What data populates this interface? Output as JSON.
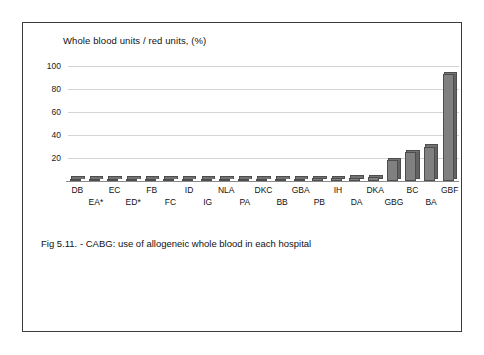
{
  "figure": {
    "caption": "Fig 5.11. - CABG: use of allogeneic whole blood in each hospital"
  },
  "chart_data": {
    "type": "bar",
    "title": "",
    "ylabel": "Whole blood units / red units, (%)",
    "xlabel": "",
    "ylim": [
      0,
      100
    ],
    "yticks": [
      100,
      80,
      60,
      40,
      20
    ],
    "ytick_labels": [
      "100",
      "80",
      "60",
      "40",
      "20"
    ],
    "grid": true,
    "legend": "none",
    "categories": [
      "DB",
      "EA*",
      "EC",
      "ED*",
      "FB",
      "FC",
      "ID",
      "IG",
      "NLA",
      "PA",
      "DKC",
      "BB",
      "GBA",
      "PB",
      "IH",
      "DA",
      "DKA",
      "GBG",
      "BC",
      "BA",
      "GBF"
    ],
    "values": [
      0,
      0,
      0,
      0,
      0,
      0,
      0,
      0,
      0,
      0,
      1.5,
      1.8,
      2.0,
      2.2,
      2.6,
      3.0,
      3.4,
      18,
      25,
      30,
      93
    ],
    "series": [
      {
        "name": "Whole blood units / red units, (%)",
        "values": [
          0,
          0,
          0,
          0,
          0,
          0,
          0,
          0,
          0,
          0,
          1.5,
          1.8,
          2.0,
          2.2,
          2.6,
          3.0,
          3.4,
          18,
          25,
          30,
          93
        ]
      }
    ],
    "colors": {
      "bar_face": "#808080",
      "bar_side": "#636363",
      "bar_outline": "#4d4d4d",
      "gridline": "#d4d4d4",
      "axis": "#8a8a8a",
      "text": "#111111",
      "frame": "#3c3c3c"
    }
  }
}
